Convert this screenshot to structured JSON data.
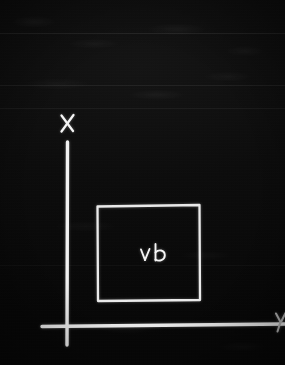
{
  "image": {
    "kind": "handwritten-diagram-photo",
    "width": 285,
    "height": 365,
    "background_color": "#070707",
    "ink_color": "#f2f2f2"
  },
  "diagram": {
    "title": "",
    "axes": {
      "vertical": {
        "label": "X",
        "label_x": 67,
        "label_y": 123,
        "line_x": 67,
        "line_y_top": 142,
        "line_y_bottom": 345
      },
      "horizontal": {
        "label": "Y",
        "label_x": 280,
        "label_y": 324,
        "label_clipped": true,
        "line_y": 325,
        "line_x_left": 42,
        "line_x_right": 285
      },
      "origin": {
        "x": 67,
        "y": 325
      }
    },
    "shapes": [
      {
        "name": "rectangle",
        "type": "rect",
        "x": 97,
        "y": 205,
        "width": 103,
        "height": 98,
        "filled": false,
        "stroke_color": "#eaeaea"
      }
    ],
    "annotations": [
      {
        "name": "inner-label",
        "text": "v b",
        "x": 152,
        "y": 255,
        "inside_shape": "rectangle"
      }
    ]
  },
  "background_bands": [
    {
      "y": 33
    },
    {
      "y": 85
    },
    {
      "y": 108
    },
    {
      "y": 265
    }
  ]
}
